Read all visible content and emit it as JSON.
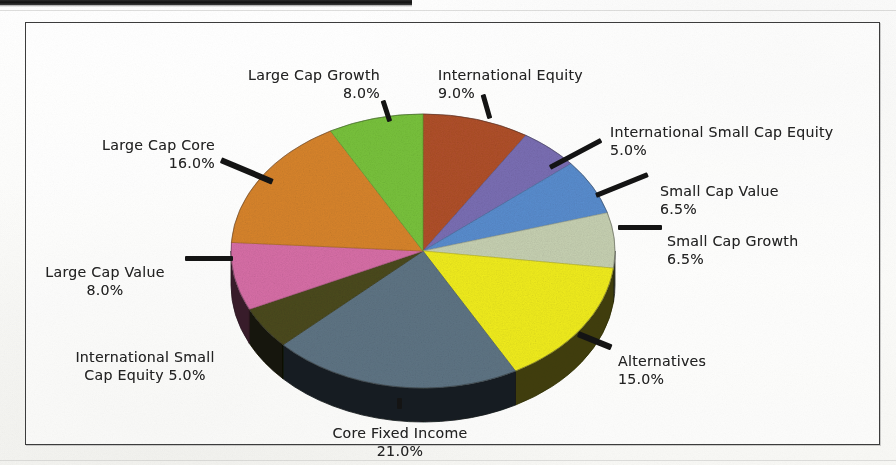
{
  "figure": {
    "frame_border_color": "#3c3c3c",
    "background_color": "#ffffff"
  },
  "chart_data": {
    "type": "pie",
    "title": "",
    "subtitle": "",
    "xlabel": "",
    "ylabel": "",
    "legend_position": "none",
    "labels_position": "outside-with-leader-lines",
    "three_d": true,
    "total_percent": "100.0%",
    "categories": [
      "International Equity",
      "International Small Cap Equity",
      "Small Cap Value",
      "Small Cap Growth",
      "Alternatives",
      "Core Fixed Income",
      "International Small Cap Equity",
      "Large Cap Value",
      "Large Cap Core",
      "Large Cap Growth"
    ],
    "values": [
      9.0,
      5.0,
      6.5,
      6.5,
      15.0,
      21.0,
      5.0,
      8.0,
      16.0,
      8.0
    ],
    "colors": [
      "#b1502a",
      "#7b6fb5",
      "#5a8ed0",
      "#c8d2b3",
      "#f2ee1f",
      "#5f7585",
      "#4b4a1c",
      "#d96fa8",
      "#d9852c",
      "#79c43c"
    ],
    "slices": [
      {
        "label": "International Equity",
        "percent": 9.0,
        "percent_text": "9.0%",
        "color": "#b1502a"
      },
      {
        "label": "International Small Cap Equity",
        "percent": 5.0,
        "percent_text": "5.0%",
        "color": "#7b6fb5"
      },
      {
        "label": "Small Cap Value",
        "percent": 6.5,
        "percent_text": "6.5%",
        "color": "#5a8ed0"
      },
      {
        "label": "Small Cap Growth",
        "percent": 6.5,
        "percent_text": "6.5%",
        "color": "#c8d2b3"
      },
      {
        "label": "Alternatives",
        "percent": 15.0,
        "percent_text": "15.0%",
        "color": "#f2ee1f"
      },
      {
        "label": "Core Fixed Income",
        "percent": 21.0,
        "percent_text": "21.0%",
        "color": "#5f7585"
      },
      {
        "label": "International Small Cap Equity",
        "percent": 5.0,
        "percent_text": "5.0%",
        "color": "#4b4a1c"
      },
      {
        "label": "Large Cap Value",
        "percent": 8.0,
        "percent_text": "8.0%",
        "color": "#d96fa8"
      },
      {
        "label": "Large Cap Core",
        "percent": 16.0,
        "percent_text": "16.0%",
        "color": "#d9852c"
      },
      {
        "label": "Large Cap Growth",
        "percent": 8.0,
        "percent_text": "8.0%",
        "color": "#79c43c"
      }
    ]
  },
  "labels": {
    "large_cap_growth": {
      "name": "Large Cap Growth",
      "percent": "8.0%"
    },
    "international_equity": {
      "name": "International Equity",
      "percent": "9.0%"
    },
    "intl_small_cap_equity_top": {
      "name": "International Small Cap Equity",
      "percent": "5.0%"
    },
    "small_cap_value": {
      "name": "Small Cap Value",
      "percent": "6.5%"
    },
    "small_cap_growth": {
      "name": "Small Cap Growth",
      "percent": "6.5%"
    },
    "alternatives": {
      "name": "Alternatives",
      "percent": "15.0%"
    },
    "core_fixed_income": {
      "name": "Core Fixed Income",
      "percent": "21.0%"
    },
    "intl_small_cap_equity_left": {
      "name": "International Small\nCap Equity 5.0%",
      "percent": ""
    },
    "large_cap_value": {
      "name": "Large Cap Value",
      "percent": "8.0%"
    },
    "large_cap_core": {
      "name": "Large Cap Core",
      "percent": "16.0%"
    }
  }
}
